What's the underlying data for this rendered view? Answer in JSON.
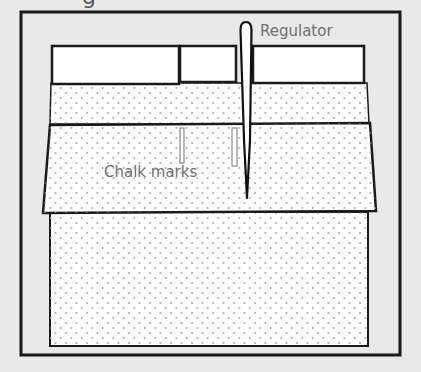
{
  "diagram": {
    "cut_heading_glyph": "g",
    "labels": {
      "regulator": "Regulator",
      "chalk_marks": "Chalk marks"
    },
    "colors": {
      "background": "#e9e9e9",
      "frame_stroke": "#1a1a1a",
      "fabric_fill": "#ffffff",
      "dot_color": "#9a9a9a",
      "label_text": "#6f6f6f",
      "chalk_mark_stroke": "#8a8a8a"
    },
    "parts": [
      {
        "name": "top-block-left",
        "type": "plain"
      },
      {
        "name": "top-block-middle",
        "type": "plain"
      },
      {
        "name": "top-block-right",
        "type": "plain"
      },
      {
        "name": "upper-fabric-band",
        "type": "dotted"
      },
      {
        "name": "folded-fabric-trapezoid",
        "type": "dotted"
      },
      {
        "name": "lower-fabric-panel",
        "type": "dotted"
      },
      {
        "name": "regulator-needle",
        "type": "tool"
      },
      {
        "name": "chalk-mark-1",
        "type": "mark"
      },
      {
        "name": "chalk-mark-2",
        "type": "mark"
      }
    ]
  }
}
